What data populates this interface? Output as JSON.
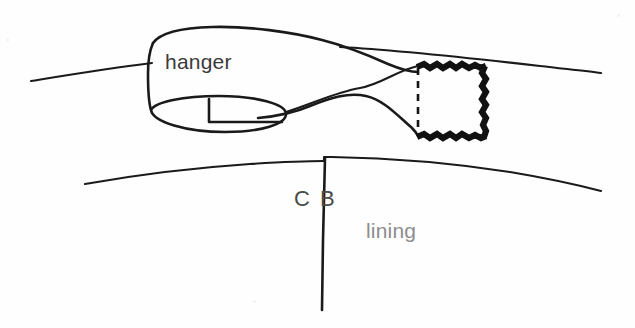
{
  "figure": {
    "kind": "hand-drawn-line-diagram",
    "background_color": "#fefefe",
    "ink_color": "#1a1a1a",
    "canvas": {
      "width": 635,
      "height": 328
    }
  },
  "labels": {
    "hanger": "hanger",
    "cb_left": "C",
    "cb_right": "B",
    "lining": "lining"
  },
  "label_colors": {
    "hanger": "#3b3b3b",
    "cb": "#4a4a4a",
    "lining": "#8d8d8d"
  },
  "parts": [
    {
      "name": "upper-garment-edge",
      "description": "long gently curving horizontal line representing the upper edge of the garment, passing behind the hanger strip"
    },
    {
      "name": "hanger-strip",
      "description": "broad folded ribbon of fabric running from the left, twisting and narrowing toward the right into the stitched patch"
    },
    {
      "name": "hanger-loop-opening",
      "description": "ellipse at the left end showing the open rolled end of the hanger strip, with a small rectangular notch detail inside"
    },
    {
      "name": "stitched-patch",
      "description": "square patch at the right end of the hanger, drawn with a thin dashed left edge and heavy zig-zag satin-stitched top, right and bottom edges"
    },
    {
      "name": "lining-edge",
      "description": "long gently curving horizontal line below, representing the top edge of the lining, with a small step at the centre back"
    },
    {
      "name": "centre-back-line",
      "description": "vertical line dropping from the step in the lining edge, marking the centre back seam"
    }
  ],
  "stitched_patch": {
    "left_edge_style": "dashed",
    "top_edge_style": "zigzag-satin-stitch",
    "right_edge_style": "zigzag-satin-stitch",
    "bottom_edge_style": "zigzag-satin-stitch"
  }
}
